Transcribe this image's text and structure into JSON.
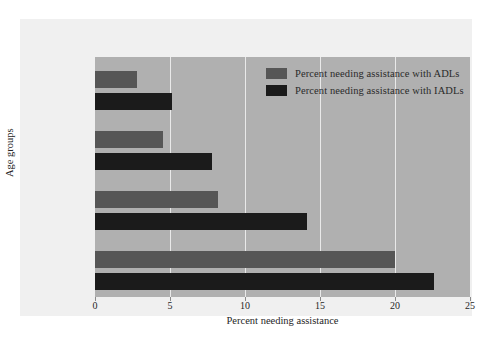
{
  "chart_data": {
    "type": "bar",
    "orientation": "horizontal",
    "title": "",
    "xlabel": "Percent needing assistance",
    "ylabel": "Age groups",
    "categories": [
      "65–69",
      "70–74",
      "75–84",
      "85+"
    ],
    "series": [
      {
        "name": "Percent needing assistance with ADLs",
        "color": "#565656",
        "values": [
          2.8,
          4.5,
          8.2,
          20.0
        ]
      },
      {
        "name": "Percent needing assistance with IADLs",
        "color": "#1b1b1b",
        "values": [
          5.1,
          7.8,
          14.1,
          22.6
        ]
      }
    ],
    "xlim": [
      0,
      25
    ],
    "xticks": [
      "0",
      "5",
      "10",
      "15",
      "20",
      "25"
    ],
    "xtick_values": [
      0,
      5,
      10,
      15,
      20,
      25
    ],
    "grid": "vertical",
    "legend_position": "top-right",
    "plot_background": "#b0b0b0",
    "figure_background": "#f0f0f0",
    "gridline_color": "#e9e9e9"
  }
}
